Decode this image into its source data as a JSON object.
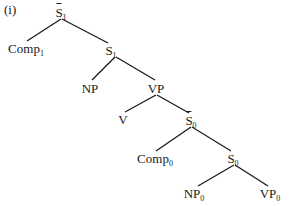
{
  "example_label": "(i)",
  "tree": {
    "nodes": [
      {
        "id": "Sbar1",
        "label": "S",
        "sub": "1",
        "bar": true,
        "x": 61,
        "y": 6
      },
      {
        "id": "Comp1",
        "label": "Comp",
        "sub": "1",
        "bar": false,
        "x": 26,
        "y": 42
      },
      {
        "id": "S1",
        "label": "S",
        "sub": "1",
        "bar": false,
        "x": 111,
        "y": 44
      },
      {
        "id": "NP",
        "label": "NP",
        "sub": "",
        "bar": false,
        "x": 90,
        "y": 82
      },
      {
        "id": "VP",
        "label": "VP",
        "sub": "",
        "bar": false,
        "x": 156,
        "y": 82
      },
      {
        "id": "V",
        "label": "V",
        "sub": "",
        "bar": false,
        "x": 123,
        "y": 113
      },
      {
        "id": "Sbar0",
        "label": "S",
        "sub": "0",
        "bar": true,
        "x": 191,
        "y": 114
      },
      {
        "id": "Comp0",
        "label": "Comp",
        "sub": "0",
        "bar": false,
        "x": 155,
        "y": 152
      },
      {
        "id": "S0",
        "label": "S",
        "sub": "0",
        "bar": false,
        "x": 233,
        "y": 152
      },
      {
        "id": "NP0",
        "label": "NP",
        "sub": "0",
        "bar": false,
        "x": 194,
        "y": 187
      },
      {
        "id": "VP0",
        "label": "VP",
        "sub": "0",
        "bar": false,
        "x": 270,
        "y": 187
      }
    ],
    "edges": [
      {
        "from": "Sbar1",
        "to": "Comp1",
        "x1": 61,
        "y1": 19,
        "x2": 27,
        "y2": 41
      },
      {
        "from": "Sbar1",
        "to": "S1",
        "x1": 62,
        "y1": 19,
        "x2": 108,
        "y2": 43
      },
      {
        "from": "S1",
        "to": "NP",
        "x1": 115,
        "y1": 57,
        "x2": 92,
        "y2": 80
      },
      {
        "from": "S1",
        "to": "VP",
        "x1": 116,
        "y1": 57,
        "x2": 155,
        "y2": 80
      },
      {
        "from": "VP",
        "to": "V",
        "x1": 156,
        "y1": 95,
        "x2": 125,
        "y2": 112
      },
      {
        "from": "VP",
        "to": "Sbar0",
        "x1": 157,
        "y1": 95,
        "x2": 189,
        "y2": 113
      },
      {
        "from": "Sbar0",
        "to": "Comp0",
        "x1": 191,
        "y1": 127,
        "x2": 156,
        "y2": 151
      },
      {
        "from": "Sbar0",
        "to": "S0",
        "x1": 192,
        "y1": 127,
        "x2": 231,
        "y2": 151
      },
      {
        "from": "S0",
        "to": "NP0",
        "x1": 234,
        "y1": 165,
        "x2": 198,
        "y2": 186
      },
      {
        "from": "S0",
        "to": "VP0",
        "x1": 235,
        "y1": 165,
        "x2": 268,
        "y2": 186
      }
    ]
  },
  "colors": {
    "ink": "#1a1a1a",
    "background": "#ffffff"
  }
}
